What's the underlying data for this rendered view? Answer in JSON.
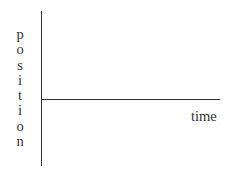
{
  "diagram": {
    "y_axis_label": "position",
    "x_axis_label": "time",
    "y_letters": [
      "p",
      "o",
      "s",
      "i",
      "t",
      "i",
      "o",
      "n"
    ]
  },
  "chart_data": {
    "type": "line",
    "title": "",
    "xlabel": "time",
    "ylabel": "position",
    "series": [
      {
        "name": "position vs time",
        "x": [
          0,
          1
        ],
        "y": [
          0,
          0
        ]
      }
    ],
    "grid": false,
    "legend": "none"
  }
}
